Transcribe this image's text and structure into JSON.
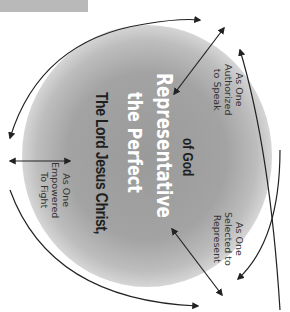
{
  "diagram": {
    "center_title": {
      "line1": "The Lord Jesus Christ,",
      "line2": "the Perfect",
      "line3": "Representative",
      "line4": "of God"
    },
    "roles": [
      {
        "line1": "As One",
        "line2": "Empowered",
        "line3": "To Fight"
      },
      {
        "line1": "As One",
        "line2": "Authorized",
        "line3": "to Speak"
      },
      {
        "line1": "As One",
        "line2": "Selected to",
        "line3": "Represent"
      }
    ],
    "colors": {
      "circle_center": "#9a9a9a",
      "title_dark": "#1e1e1e",
      "title_light": "#ffffff",
      "arrow": "#222222",
      "top_bar": "#b9b9b9"
    }
  }
}
